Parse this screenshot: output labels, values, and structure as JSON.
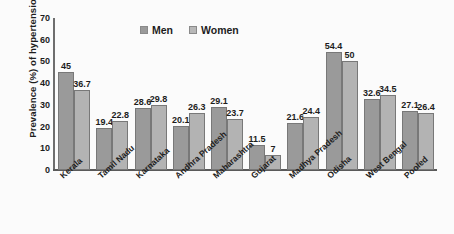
{
  "chart_data": {
    "type": "bar",
    "title": "",
    "xlabel": "",
    "ylabel": "Prevalence (%) of hypertension",
    "ylim": [
      0,
      70
    ],
    "yticks": [
      0,
      10,
      20,
      30,
      40,
      50,
      60,
      70
    ],
    "grid": false,
    "legend_position": "top-center",
    "categories": [
      "Kerala",
      "Tamil Nadu",
      "Karnataka",
      "Andhra Pradesh",
      "Maharashtra",
      "Gujarat",
      "Madhya Pradesh",
      "Odisha",
      "West Bengal",
      "Pooled"
    ],
    "series": [
      {
        "name": "Men",
        "color": "#9a9a9a",
        "values": [
          45,
          19.4,
          28.6,
          20.1,
          29.1,
          11.5,
          21.6,
          54.4,
          32.6,
          27.1
        ],
        "labels": [
          "45",
          "19.4",
          "28.6",
          "20.1",
          "29.1",
          "11.5",
          "21.6",
          "54.4",
          "32.6",
          "27.1"
        ]
      },
      {
        "name": "Women",
        "color": "#b3b3b3",
        "values": [
          36.7,
          22.8,
          29.8,
          26.3,
          23.7,
          7,
          24.4,
          50,
          34.5,
          26.4
        ],
        "labels": [
          "36.7",
          "22.8",
          "29.8",
          "26.3",
          "23.7",
          "7",
          "24.4",
          "50",
          "34.5",
          "26.4"
        ]
      }
    ]
  }
}
